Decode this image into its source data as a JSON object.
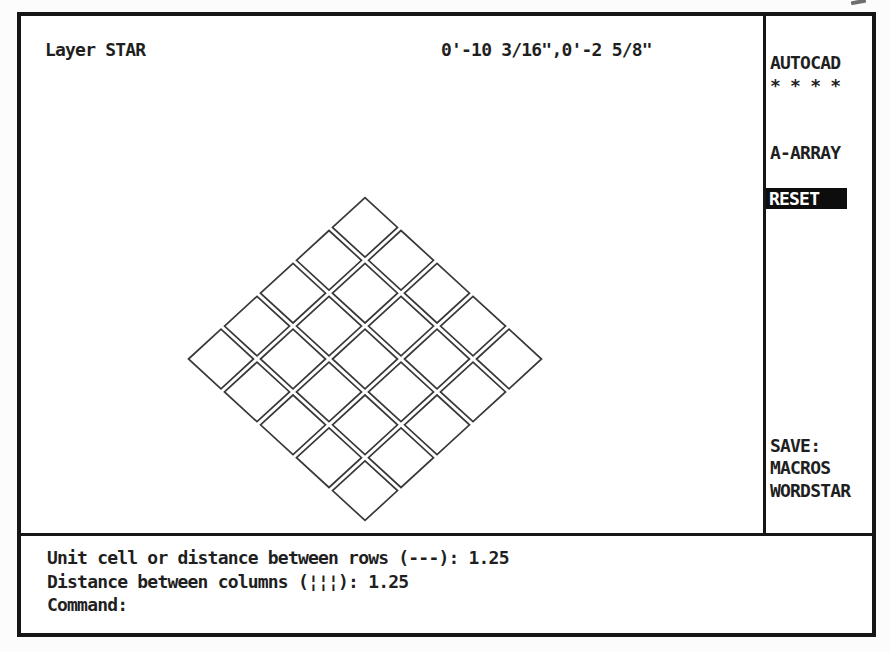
{
  "palette": {
    "text": "#1f1f1f",
    "frame": "#161616",
    "highlight_bg": "#0d0d0d",
    "highlight_fg": "#ffffff",
    "entity_stroke": "#383838",
    "screen_bg": "#ffffff"
  },
  "status_bar": {
    "layer": "Layer STAR",
    "coordinates": "0'-10 3/16\",0'-2 5/8\""
  },
  "screen_menu": {
    "rows": [
      {
        "label": "AUTOCAD",
        "highlighted": false
      },
      {
        "label": "* * * *",
        "highlighted": false
      },
      {
        "label": "",
        "highlighted": false
      },
      {
        "label": "",
        "highlighted": false
      },
      {
        "label": "A-ARRAY",
        "highlighted": false
      },
      {
        "label": "",
        "highlighted": false
      },
      {
        "label": "RESET",
        "highlighted": true
      },
      {
        "label": "",
        "highlighted": false
      },
      {
        "label": "",
        "highlighted": false
      },
      {
        "label": "",
        "highlighted": false
      },
      {
        "label": "",
        "highlighted": false
      },
      {
        "label": "",
        "highlighted": false
      },
      {
        "label": "",
        "highlighted": false
      },
      {
        "label": "",
        "highlighted": false
      },
      {
        "label": "",
        "highlighted": false
      },
      {
        "label": "",
        "highlighted": false
      },
      {
        "label": "",
        "highlighted": false
      },
      {
        "label": "SAVE:",
        "highlighted": false
      },
      {
        "label": "MACROS",
        "highlighted": false
      },
      {
        "label": "WORDSTAR",
        "highlighted": false
      }
    ]
  },
  "command_area": {
    "lines": [
      "Unit cell or distance between rows (---): 1.25",
      "Distance between columns (¦¦¦): 1.25",
      "Command:"
    ]
  },
  "drawing": {
    "entity": "array-of-rotated-squares",
    "rows": 5,
    "cols": 5,
    "rotation_deg": 45,
    "row_spacing": 1.25,
    "col_spacing": 1.25,
    "geometry": {
      "cx": 344,
      "cy": 343,
      "step_x": 36,
      "step_y": 32.9,
      "half_w": 32.5,
      "half_h": 29.8,
      "stroke_width": 1.7
    }
  }
}
